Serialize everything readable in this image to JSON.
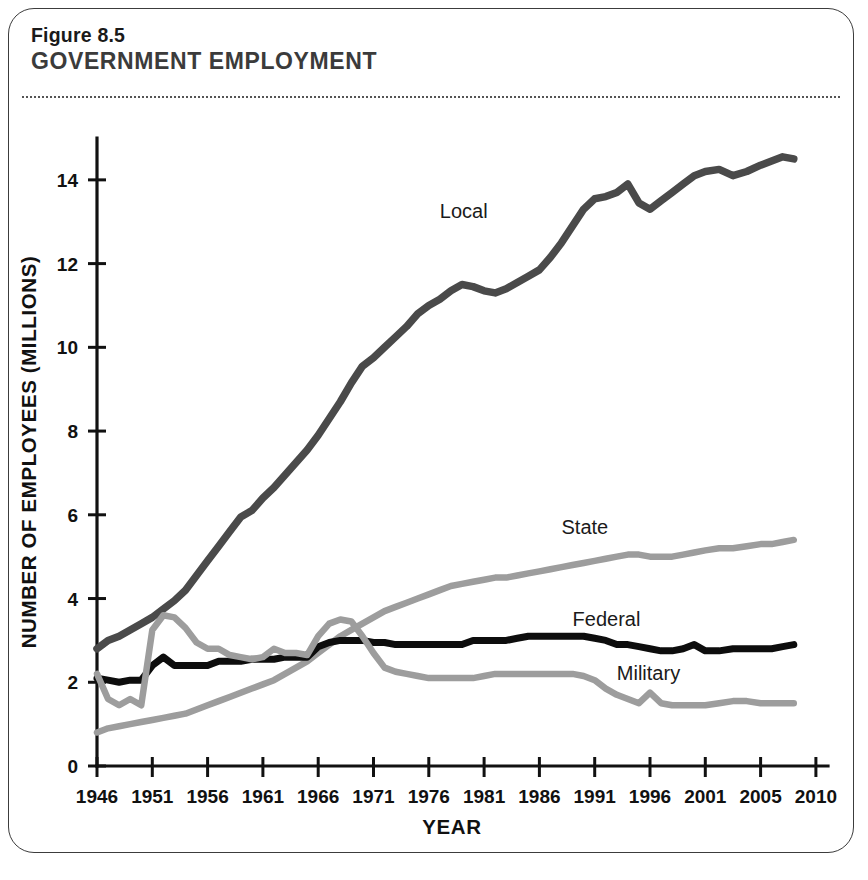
{
  "figure": {
    "number": "Figure 8.5",
    "title": "GOVERNMENT EMPLOYMENT"
  },
  "colors": {
    "local_line": "#4a4a4a",
    "federal_line": "#0d0d0d",
    "state_line": "#9d9d9d",
    "military_line": "#9d9d9d",
    "axis": "#111111",
    "frame": "#3c3c3c"
  },
  "chart_data": {
    "type": "line",
    "title": "GOVERNMENT EMPLOYMENT",
    "xlabel": "YEAR",
    "ylabel": "NUMBER OF EMPLOYEES (MILLIONS)",
    "xlim": [
      1946,
      2010
    ],
    "ylim": [
      0,
      15
    ],
    "grid": false,
    "legend_position": "inline-labels",
    "x_tick_labels": [
      "1946",
      "1951",
      "1956",
      "1961",
      "1966",
      "1971",
      "1976",
      "1981",
      "1986",
      "1991",
      "1996",
      "2001",
      "2005",
      "2010"
    ],
    "x_tick_values": [
      1946,
      1951,
      1956,
      1961,
      1966,
      1971,
      1976,
      1981,
      1986,
      1991,
      1996,
      2001,
      2005,
      2010
    ],
    "y_tick_labels": [
      "0",
      "2",
      "4",
      "6",
      "8",
      "10",
      "12",
      "14"
    ],
    "y_tick_values": [
      0,
      2,
      4,
      6,
      8,
      10,
      12,
      14
    ],
    "x": [
      1946,
      1947,
      1948,
      1949,
      1950,
      1951,
      1952,
      1953,
      1954,
      1955,
      1956,
      1957,
      1958,
      1959,
      1960,
      1961,
      1962,
      1963,
      1964,
      1965,
      1966,
      1967,
      1968,
      1969,
      1970,
      1971,
      1972,
      1973,
      1974,
      1975,
      1976,
      1977,
      1978,
      1979,
      1980,
      1981,
      1982,
      1983,
      1984,
      1985,
      1986,
      1987,
      1988,
      1989,
      1990,
      1991,
      1992,
      1993,
      1994,
      1995,
      1996,
      1997,
      1998,
      1999,
      2000,
      2001,
      2002,
      2003,
      2004,
      2005,
      2006,
      2007,
      2008
    ],
    "series": [
      {
        "name": "Local",
        "color": "#4a4a4a",
        "label_x": 1977,
        "label_y": 13.1,
        "values": [
          2.8,
          3.0,
          3.1,
          3.25,
          3.4,
          3.55,
          3.75,
          3.95,
          4.2,
          4.55,
          4.9,
          5.25,
          5.6,
          5.95,
          6.1,
          6.4,
          6.65,
          6.95,
          7.25,
          7.55,
          7.9,
          8.3,
          8.7,
          9.15,
          9.55,
          9.75,
          10.0,
          10.25,
          10.5,
          10.8,
          11.0,
          11.15,
          11.35,
          11.5,
          11.45,
          11.35,
          11.3,
          11.4,
          11.55,
          11.7,
          11.85,
          12.15,
          12.5,
          12.9,
          13.3,
          13.55,
          13.6,
          13.7,
          13.9,
          13.45,
          13.3,
          13.5,
          13.7,
          13.9,
          14.1,
          14.2,
          14.25,
          14.1,
          14.2,
          14.35,
          14.45,
          14.55,
          14.5
        ]
      },
      {
        "name": "State",
        "color": "#9d9d9d",
        "label_x": 1988,
        "label_y": 5.55,
        "values": [
          0.8,
          0.9,
          0.95,
          1.0,
          1.05,
          1.1,
          1.15,
          1.2,
          1.25,
          1.35,
          1.45,
          1.55,
          1.65,
          1.75,
          1.85,
          1.95,
          2.05,
          2.2,
          2.35,
          2.5,
          2.7,
          2.9,
          3.1,
          3.25,
          3.4,
          3.55,
          3.7,
          3.8,
          3.9,
          4.0,
          4.1,
          4.2,
          4.3,
          4.35,
          4.4,
          4.45,
          4.5,
          4.5,
          4.55,
          4.6,
          4.65,
          4.7,
          4.75,
          4.8,
          4.85,
          4.9,
          4.95,
          5.0,
          5.05,
          5.05,
          5.0,
          5.0,
          5.0,
          5.05,
          5.1,
          5.15,
          5.2,
          5.2,
          5.25,
          5.3,
          5.3,
          5.35,
          5.4
        ]
      },
      {
        "name": "Federal",
        "color": "#0d0d0d",
        "label_x": 1989,
        "label_y": 3.35,
        "values": [
          2.1,
          2.05,
          2.0,
          2.05,
          2.05,
          2.4,
          2.6,
          2.4,
          2.4,
          2.4,
          2.4,
          2.5,
          2.5,
          2.5,
          2.55,
          2.55,
          2.55,
          2.6,
          2.6,
          2.6,
          2.85,
          2.95,
          3.0,
          3.0,
          3.0,
          2.95,
          2.95,
          2.9,
          2.9,
          2.9,
          2.9,
          2.9,
          2.9,
          2.9,
          3.0,
          3.0,
          3.0,
          3.0,
          3.05,
          3.1,
          3.1,
          3.1,
          3.1,
          3.1,
          3.1,
          3.05,
          3.0,
          2.9,
          2.9,
          2.85,
          2.8,
          2.75,
          2.75,
          2.8,
          2.9,
          2.75,
          2.75,
          2.8,
          2.8,
          2.8,
          2.8,
          2.85,
          2.9
        ]
      },
      {
        "name": "Military",
        "color": "#9d9d9d",
        "label_x": 1993,
        "label_y": 2.05,
        "values": [
          2.2,
          1.6,
          1.45,
          1.6,
          1.45,
          3.25,
          3.6,
          3.55,
          3.3,
          2.95,
          2.8,
          2.8,
          2.65,
          2.6,
          2.55,
          2.6,
          2.8,
          2.7,
          2.7,
          2.65,
          3.1,
          3.4,
          3.5,
          3.45,
          3.1,
          2.7,
          2.35,
          2.25,
          2.2,
          2.15,
          2.1,
          2.1,
          2.1,
          2.1,
          2.1,
          2.15,
          2.2,
          2.2,
          2.2,
          2.2,
          2.2,
          2.2,
          2.2,
          2.2,
          2.15,
          2.05,
          1.85,
          1.7,
          1.6,
          1.5,
          1.75,
          1.5,
          1.45,
          1.45,
          1.45,
          1.45,
          1.5,
          1.55,
          1.55,
          1.5,
          1.5,
          1.5,
          1.5
        ]
      }
    ]
  }
}
